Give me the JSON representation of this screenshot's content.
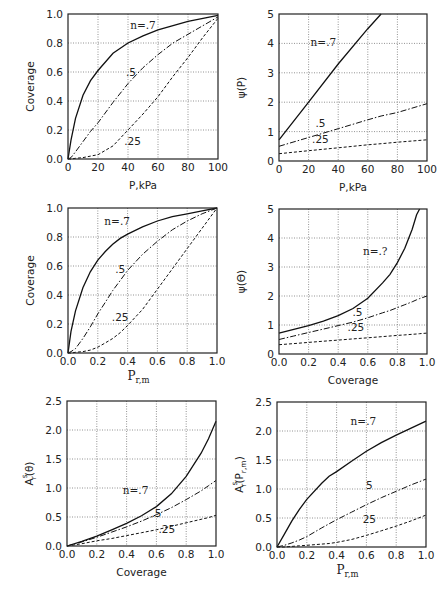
{
  "figure": {
    "panels_count": 6,
    "layout": "3 rows x 2 columns",
    "grid": "dotted"
  },
  "chart_data": [
    {
      "id": "p1",
      "type": "line",
      "title": "",
      "xlabel": "P,kPa",
      "ylabel": "Coverage",
      "xlim": [
        0,
        100
      ],
      "ylim": [
        0,
        1.0
      ],
      "xticks": [
        "0",
        "20",
        "40",
        "60",
        "80",
        "100"
      ],
      "yticks": [
        "0.0",
        "0.2",
        "0.4",
        "0.6",
        "0.8",
        "1.0"
      ],
      "grid": true,
      "frame": {
        "x0": 68,
        "y0": 14,
        "x1": 218,
        "y1": 159
      },
      "x": [
        0,
        2,
        5,
        10,
        15,
        20,
        30,
        40,
        50,
        60,
        70,
        80,
        90,
        100
      ],
      "series": [
        {
          "name": "n=.7",
          "style": "solid",
          "values": [
            0,
            0.13,
            0.28,
            0.44,
            0.54,
            0.61,
            0.73,
            0.8,
            0.85,
            0.89,
            0.92,
            0.95,
            0.97,
            0.99
          ]
        },
        {
          "name": ".5",
          "style": "dashdot",
          "values": [
            0,
            0.01,
            0.05,
            0.12,
            0.19,
            0.25,
            0.39,
            0.52,
            0.63,
            0.72,
            0.8,
            0.86,
            0.92,
            0.98
          ]
        },
        {
          "name": ".25",
          "style": "dashed",
          "values": [
            0,
            0,
            0.005,
            0.01,
            0.02,
            0.03,
            0.09,
            0.2,
            0.31,
            0.43,
            0.57,
            0.7,
            0.84,
            0.97
          ]
        }
      ],
      "annotations": [
        {
          "text": "n=.7",
          "x": 50,
          "y": 0.9
        },
        {
          "text": ".5",
          "x": 42,
          "y": 0.57
        },
        {
          "text": ".25",
          "x": 43,
          "y": 0.1
        }
      ]
    },
    {
      "id": "p2",
      "type": "line",
      "title": "",
      "xlabel": "P,kPa",
      "ylabel": "ψ(P)",
      "xlim": [
        0,
        100
      ],
      "ylim": [
        0,
        5
      ],
      "xticks": [
        "0",
        "20",
        "40",
        "60",
        "80",
        "100"
      ],
      "yticks": [
        "0",
        "1",
        "2",
        "3",
        "4",
        "5"
      ],
      "grid": true,
      "frame": {
        "x0": 279,
        "y0": 14,
        "x1": 427,
        "y1": 161
      },
      "x": [
        0,
        20,
        40,
        60,
        69,
        80,
        100
      ],
      "series": [
        {
          "name": "n=.7",
          "style": "solid",
          "values": [
            0.72,
            2.0,
            3.3,
            4.5,
            5.0,
            null,
            null
          ]
        },
        {
          "name": ".5",
          "style": "dashdot",
          "values": [
            0.5,
            0.8,
            1.1,
            1.4,
            1.53,
            1.65,
            1.95
          ]
        },
        {
          "name": ".25",
          "style": "dashed",
          "values": [
            0.25,
            0.35,
            0.45,
            0.55,
            0.59,
            0.64,
            0.72
          ]
        }
      ],
      "annotations": [
        {
          "text": "n=.7",
          "x": 30,
          "y": 3.9
        },
        {
          "text": ".5",
          "x": 28,
          "y": 1.15
        },
        {
          "text": ".25",
          "x": 28,
          "y": 0.6
        }
      ]
    },
    {
      "id": "p3",
      "type": "line",
      "title": "",
      "xlabel": "Pr,m",
      "xlabel_main": "P",
      "xlabel_sub": "r,m",
      "ylabel": "Coverage",
      "xlim": [
        0,
        1.0
      ],
      "ylim": [
        0,
        1.0
      ],
      "xticks": [
        "0.0",
        "0.2",
        "0.4",
        "0.6",
        "0.8",
        "1.0"
      ],
      "yticks": [
        "0.0",
        "0.2",
        "0.4",
        "0.6",
        "0.8",
        "1.0"
      ],
      "grid": true,
      "frame": {
        "x0": 68,
        "y0": 208,
        "x1": 217,
        "y1": 353
      },
      "x": [
        0,
        0.02,
        0.05,
        0.1,
        0.15,
        0.2,
        0.25,
        0.3,
        0.35,
        0.4,
        0.5,
        0.6,
        0.7,
        0.8,
        0.9,
        1.0
      ],
      "series": [
        {
          "name": "n=.7",
          "style": "solid",
          "values": [
            0,
            0.15,
            0.29,
            0.45,
            0.56,
            0.64,
            0.7,
            0.75,
            0.79,
            0.82,
            0.87,
            0.91,
            0.94,
            0.96,
            0.98,
            1.0
          ]
        },
        {
          "name": ".5",
          "style": "dashdot",
          "values": [
            0,
            0.01,
            0.03,
            0.1,
            0.18,
            0.27,
            0.35,
            0.43,
            0.5,
            0.57,
            0.68,
            0.77,
            0.85,
            0.91,
            0.96,
            1.0
          ]
        },
        {
          "name": ".25",
          "style": "dashed",
          "values": [
            0,
            0,
            0.005,
            0.01,
            0.02,
            0.04,
            0.07,
            0.1,
            0.14,
            0.19,
            0.3,
            0.44,
            0.58,
            0.72,
            0.86,
            1.0
          ]
        }
      ],
      "annotations": [
        {
          "text": "n=.7",
          "x": 0.33,
          "y": 0.88
        },
        {
          "text": ".5",
          "x": 0.35,
          "y": 0.55
        },
        {
          "text": ".25",
          "x": 0.35,
          "y": 0.22
        }
      ]
    },
    {
      "id": "p4",
      "type": "line",
      "title": "",
      "xlabel": "Coverage",
      "ylabel": "ψ(Θ)",
      "xlim": [
        0,
        1.0
      ],
      "ylim": [
        0,
        5
      ],
      "xticks": [
        "0.0",
        "0.2",
        "0.4",
        "0.6",
        "0.8",
        "1.0"
      ],
      "yticks": [
        "0",
        "1",
        "2",
        "3",
        "4",
        "5"
      ],
      "grid": true,
      "frame": {
        "x0": 279,
        "y0": 209,
        "x1": 427,
        "y1": 354
      },
      "x": [
        0,
        0.1,
        0.2,
        0.3,
        0.4,
        0.5,
        0.6,
        0.7,
        0.75,
        0.8,
        0.85,
        0.9,
        0.93,
        0.95,
        1.0
      ],
      "series": [
        {
          "name": "n=.7",
          "style": "solid",
          "values": [
            0.72,
            0.85,
            0.98,
            1.13,
            1.32,
            1.57,
            1.92,
            2.45,
            2.75,
            3.15,
            3.65,
            4.3,
            4.8,
            5.0,
            null
          ]
        },
        {
          "name": ".5",
          "style": "dashdot",
          "values": [
            0.5,
            0.62,
            0.74,
            0.86,
            0.98,
            1.1,
            1.25,
            1.42,
            1.5,
            1.6,
            1.7,
            1.8,
            1.87,
            1.91,
            2.0
          ]
        },
        {
          "name": ".25",
          "style": "dashed",
          "values": [
            0.32,
            0.36,
            0.4,
            0.44,
            0.48,
            0.52,
            0.56,
            0.6,
            0.62,
            0.64,
            0.66,
            0.68,
            0.69,
            0.7,
            0.72
          ]
        }
      ],
      "annotations": [
        {
          "text": "n=.?",
          "x": 0.65,
          "y": 3.4
        },
        {
          "text": ".5",
          "x": 0.53,
          "y": 1.3
        },
        {
          "text": ".25",
          "x": 0.52,
          "y": 0.8
        }
      ]
    },
    {
      "id": "p5",
      "type": "line",
      "title": "",
      "xlabel": "Coverage",
      "ylabel": "A^s_r(θ)",
      "ylabel_main": "A",
      "ylabel_sup": "s",
      "ylabel_sub": "r",
      "ylabel_arg": "(θ)",
      "xlim": [
        0,
        1.0
      ],
      "ylim": [
        0,
        2.5
      ],
      "xticks": [
        "0.0",
        "0.2",
        "0.4",
        "0.6",
        "0.8",
        "1.0"
      ],
      "yticks": [
        "0.0",
        "0.5",
        "1.0",
        "1.5",
        "2.0",
        "2.5"
      ],
      "grid": true,
      "frame": {
        "x0": 67,
        "y0": 401,
        "x1": 216,
        "y1": 546
      },
      "x": [
        0,
        0.1,
        0.2,
        0.3,
        0.4,
        0.5,
        0.6,
        0.7,
        0.8,
        0.9,
        0.95,
        1.0
      ],
      "series": [
        {
          "name": "n=.7",
          "style": "solid",
          "values": [
            0,
            0.08,
            0.17,
            0.28,
            0.39,
            0.52,
            0.68,
            0.9,
            1.2,
            1.6,
            1.85,
            2.15
          ]
        },
        {
          "name": ".5",
          "style": "dashdot",
          "values": [
            0,
            0.07,
            0.15,
            0.24,
            0.33,
            0.43,
            0.54,
            0.66,
            0.8,
            0.95,
            1.04,
            1.13
          ]
        },
        {
          "name": ".25",
          "style": "dashed",
          "values": [
            0,
            0.04,
            0.09,
            0.13,
            0.18,
            0.23,
            0.28,
            0.34,
            0.4,
            0.46,
            0.49,
            0.53
          ]
        }
      ],
      "annotations": [
        {
          "text": "n=.7",
          "x": 0.46,
          "y": 0.9
        },
        {
          "text": ".5",
          "x": 0.6,
          "y": 0.5
        },
        {
          "text": ".25",
          "x": 0.67,
          "y": 0.22
        }
      ]
    },
    {
      "id": "p6",
      "type": "line",
      "title": "",
      "xlabel": "Pr,m",
      "xlabel_main": "P",
      "xlabel_sub": "r,m",
      "ylabel": "A^s_r(Pr,m)",
      "ylabel_main": "A",
      "ylabel_sup": "s",
      "ylabel_sub": "r",
      "ylabel_arg": "(P",
      "ylabel_arg_sub": "r,m",
      "ylabel_close": ")",
      "xlim": [
        0,
        1.0
      ],
      "ylim": [
        0,
        2.5
      ],
      "xticks": [
        "0.0",
        "0.2",
        "0.4",
        "0.6",
        "0.8",
        "1.0"
      ],
      "yticks": [
        "0.0",
        "0.5",
        "1.0",
        "1.5",
        "2.0",
        "2.5"
      ],
      "grid": true,
      "frame": {
        "x0": 277,
        "y0": 402,
        "x1": 426,
        "y1": 547
      },
      "x": [
        0,
        0.05,
        0.1,
        0.15,
        0.2,
        0.3,
        0.35,
        0.4,
        0.5,
        0.6,
        0.7,
        0.8,
        0.9,
        1.0
      ],
      "series": [
        {
          "name": "n=.7",
          "style": "solid",
          "values": [
            0,
            0.22,
            0.45,
            0.65,
            0.82,
            1.1,
            1.22,
            1.3,
            1.48,
            1.65,
            1.8,
            1.93,
            2.05,
            2.17
          ]
        },
        {
          "name": ".5",
          "style": "dashdot",
          "values": [
            0,
            0.03,
            0.07,
            0.12,
            0.18,
            0.33,
            0.4,
            0.47,
            0.6,
            0.73,
            0.85,
            0.96,
            1.07,
            1.17
          ]
        },
        {
          "name": ".25",
          "style": "dashed",
          "values": [
            0,
            0,
            0.01,
            0.02,
            0.03,
            0.05,
            0.06,
            0.08,
            0.13,
            0.2,
            0.28,
            0.36,
            0.45,
            0.55
          ]
        }
      ],
      "annotations": [
        {
          "text": "n=.7",
          "x": 0.58,
          "y": 2.1
        },
        {
          "text": "5",
          "x": 0.62,
          "y": 1.0
        },
        {
          "text": "25",
          "x": 0.62,
          "y": 0.42
        }
      ]
    }
  ]
}
